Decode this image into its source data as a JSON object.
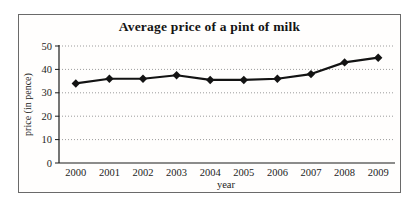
{
  "chart_data": {
    "type": "line",
    "title": "Average price of a pint of milk",
    "xlabel": "year",
    "ylabel": "price (in pence)",
    "categories": [
      "2000",
      "2001",
      "2002",
      "2003",
      "2004",
      "2005",
      "2006",
      "2007",
      "2008",
      "2009"
    ],
    "values": [
      34,
      36,
      36,
      37.5,
      35.5,
      35.5,
      36,
      38,
      43,
      45
    ],
    "ylim": [
      0,
      50
    ],
    "yticks": [
      0,
      10,
      20,
      30,
      40,
      50
    ],
    "grid": "horizontal-dotted",
    "legend": "none",
    "marker": "diamond",
    "line_color": "#131313",
    "grid_color": "#9c9c9c",
    "axis_color": "#1a1a1a",
    "frame_border_color": "#6a6a6a",
    "background": "#ffffff"
  }
}
